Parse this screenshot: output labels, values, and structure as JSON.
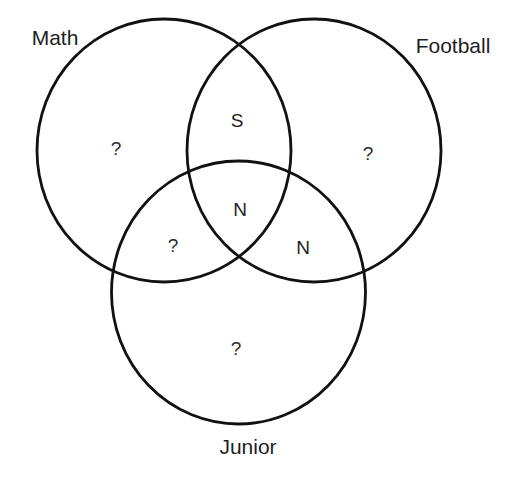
{
  "diagram": {
    "type": "venn",
    "stroke_color": "#111111",
    "text_color": "#1e1e1e",
    "background": "#ffffff",
    "sets": [
      {
        "id": "math",
        "label": "Math",
        "shape": {
          "cx": 164,
          "cy": 150.5,
          "rx": 127,
          "ry": 131.5
        },
        "label_pos": {
          "x": 55,
          "y": 45
        }
      },
      {
        "id": "football",
        "label": "Football",
        "shape": {
          "cx": 314,
          "cy": 150.5,
          "rx": 127,
          "ry": 131.5
        },
        "label_pos": {
          "x": 453,
          "y": 53
        }
      },
      {
        "id": "junior",
        "label": "Junior",
        "shape": {
          "cx": 238.5,
          "cy": 292.5,
          "rx": 127,
          "ry": 131.5
        },
        "label_pos": {
          "x": 248,
          "y": 454
        }
      }
    ],
    "regions": [
      {
        "id": "math-only",
        "sets": [
          "Math"
        ],
        "label": "?",
        "pos": {
          "x": 116,
          "y": 155
        }
      },
      {
        "id": "football-only",
        "sets": [
          "Football"
        ],
        "label": "?",
        "pos": {
          "x": 368,
          "y": 160
        }
      },
      {
        "id": "math-football",
        "sets": [
          "Math",
          "Football"
        ],
        "label": "S",
        "pos": {
          "x": 237,
          "y": 127
        }
      },
      {
        "id": "math-football-junior",
        "sets": [
          "Math",
          "Football",
          "Junior"
        ],
        "label": "N",
        "pos": {
          "x": 240,
          "y": 216
        }
      },
      {
        "id": "math-junior",
        "sets": [
          "Math",
          "Junior"
        ],
        "label": "?",
        "pos": {
          "x": 173,
          "y": 252
        }
      },
      {
        "id": "football-junior",
        "sets": [
          "Football",
          "Junior"
        ],
        "label": "N",
        "pos": {
          "x": 303,
          "y": 254
        }
      },
      {
        "id": "junior-only",
        "sets": [
          "Junior"
        ],
        "label": "?",
        "pos": {
          "x": 236,
          "y": 355
        }
      }
    ]
  }
}
